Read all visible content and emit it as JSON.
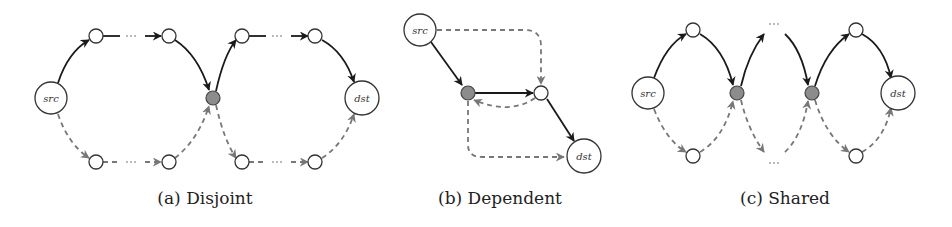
{
  "figure": {
    "panels": [
      {
        "id": "a",
        "caption": "(a) Disjoint",
        "nodes": [
          {
            "id": "src",
            "label": "src",
            "kind": "endpoint"
          },
          {
            "id": "t1",
            "label": "",
            "kind": "relay"
          },
          {
            "id": "t2",
            "label": "",
            "kind": "relay"
          },
          {
            "id": "b1",
            "label": "",
            "kind": "relay"
          },
          {
            "id": "b2",
            "label": "",
            "kind": "relay"
          },
          {
            "id": "mid",
            "label": "",
            "kind": "shared"
          },
          {
            "id": "t3",
            "label": "",
            "kind": "relay"
          },
          {
            "id": "t4",
            "label": "",
            "kind": "relay"
          },
          {
            "id": "b3",
            "label": "",
            "kind": "relay"
          },
          {
            "id": "b4",
            "label": "",
            "kind": "relay"
          },
          {
            "id": "dst",
            "label": "dst",
            "kind": "endpoint"
          }
        ],
        "edges": {
          "solid": [
            "src->t1",
            "t1...t2",
            "t2->mid",
            "mid->t3",
            "t3...t4",
            "t4->dst"
          ],
          "dashed": [
            "src->b1",
            "b1...b2",
            "b2->mid",
            "mid->b3",
            "b3...b4",
            "b4->dst"
          ]
        },
        "ellipsis": "···"
      },
      {
        "id": "b",
        "caption": "(b) Dependent",
        "nodes": [
          {
            "id": "src",
            "label": "src",
            "kind": "endpoint"
          },
          {
            "id": "g",
            "label": "",
            "kind": "shared"
          },
          {
            "id": "w",
            "label": "",
            "kind": "relay"
          },
          {
            "id": "dst",
            "label": "dst",
            "kind": "endpoint"
          }
        ],
        "edges": {
          "solid": [
            "src->g",
            "g->w",
            "w->dst"
          ],
          "dashed": [
            "src->w",
            "w->g",
            "g->dst"
          ]
        }
      },
      {
        "id": "c",
        "caption": "(c) Shared",
        "nodes": [
          {
            "id": "src",
            "label": "src",
            "kind": "endpoint"
          },
          {
            "id": "t1",
            "label": "",
            "kind": "relay"
          },
          {
            "id": "b1",
            "label": "",
            "kind": "relay"
          },
          {
            "id": "g1",
            "label": "",
            "kind": "shared"
          },
          {
            "id": "g2",
            "label": "",
            "kind": "shared"
          },
          {
            "id": "t2",
            "label": "",
            "kind": "relay"
          },
          {
            "id": "b2",
            "label": "",
            "kind": "relay"
          },
          {
            "id": "dst",
            "label": "dst",
            "kind": "endpoint"
          }
        ],
        "edges": {
          "solid": [
            "src->t1",
            "t1->g1",
            "g1->...",
            "...->g2",
            "g2->t2",
            "t2->dst"
          ],
          "dashed": [
            "src->b1",
            "b1->g1",
            "g1->...",
            "...->g2",
            "g2->b2",
            "b2->dst"
          ]
        },
        "ellipsis": "···"
      }
    ],
    "colors": {
      "solid_edge": "#1a1a1a",
      "dashed_edge": "#777777",
      "shared_node": "#8c8c8c",
      "node_fill": "#ffffff"
    }
  }
}
